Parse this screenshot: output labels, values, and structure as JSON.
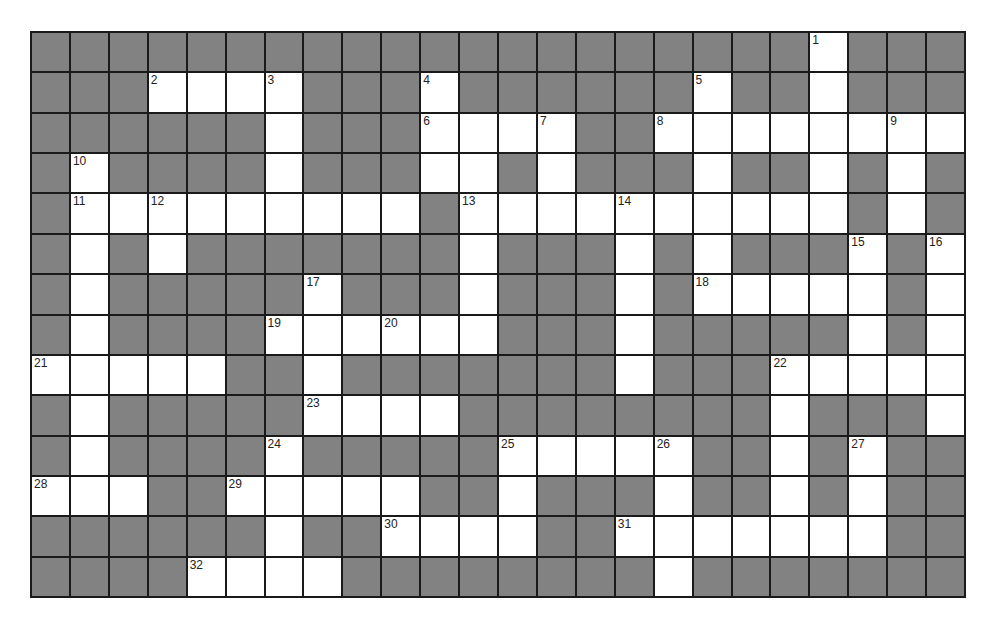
{
  "puzzle": {
    "type": "crossword",
    "columns": 24,
    "rows": 14,
    "colors": {
      "block": "#828282",
      "open": "#ffffff",
      "grid_line": "#1a1a1a"
    },
    "grid": [
      "XXXXXXXXXXXXXXXXXXXXWXXX",
      "XXXWWWWXXXWXXXXXXWXXWXXX",
      "XXXXXXWXXXWWWWXXWWWWWWWW",
      "XWXXXXWXXXWWXWXXXWXXWXWX",
      "XWWWWWWWWWXWWWWWWWWWWXWX",
      "XWXWXXXXXXXWXXXWXWXXXWXW",
      "XWXXXXXWXXXWXXXWXWWWWWXW",
      "XWXXXXWWWWWWXXXWXXXXXWXW",
      "WWWWWXXWXXXXXXXWXXXWWWWW",
      "XWXXXXXWWWWXXXXXXXXWXXXW",
      "XWXXXXWXXXXXWWWWWXXWXWXX",
      "WWWXXWWWWWXXWXXXWXXWXWXX",
      "XXXXXXWXXWWWWXXWWWWWWWXX",
      "XXXXWWWWXXXXXXXXWXXXXXXX"
    ],
    "numbers": [
      {
        "n": "1",
        "row": 0,
        "col": 20
      },
      {
        "n": "2",
        "row": 1,
        "col": 3
      },
      {
        "n": "3",
        "row": 1,
        "col": 6
      },
      {
        "n": "4",
        "row": 1,
        "col": 10
      },
      {
        "n": "5",
        "row": 1,
        "col": 17
      },
      {
        "n": "6",
        "row": 2,
        "col": 10
      },
      {
        "n": "7",
        "row": 2,
        "col": 13
      },
      {
        "n": "8",
        "row": 2,
        "col": 16
      },
      {
        "n": "9",
        "row": 2,
        "col": 22
      },
      {
        "n": "10",
        "row": 3,
        "col": 1
      },
      {
        "n": "11",
        "row": 4,
        "col": 1
      },
      {
        "n": "12",
        "row": 4,
        "col": 3
      },
      {
        "n": "13",
        "row": 4,
        "col": 11
      },
      {
        "n": "14",
        "row": 4,
        "col": 15
      },
      {
        "n": "15",
        "row": 5,
        "col": 21
      },
      {
        "n": "16",
        "row": 5,
        "col": 23
      },
      {
        "n": "17",
        "row": 6,
        "col": 7
      },
      {
        "n": "18",
        "row": 6,
        "col": 17
      },
      {
        "n": "19",
        "row": 7,
        "col": 6
      },
      {
        "n": "20",
        "row": 7,
        "col": 9
      },
      {
        "n": "21",
        "row": 8,
        "col": 0
      },
      {
        "n": "22",
        "row": 8,
        "col": 19
      },
      {
        "n": "23",
        "row": 9,
        "col": 7
      },
      {
        "n": "24",
        "row": 10,
        "col": 6
      },
      {
        "n": "25",
        "row": 10,
        "col": 12
      },
      {
        "n": "26",
        "row": 10,
        "col": 16
      },
      {
        "n": "27",
        "row": 10,
        "col": 21
      },
      {
        "n": "28",
        "row": 11,
        "col": 0
      },
      {
        "n": "29",
        "row": 11,
        "col": 5
      },
      {
        "n": "30",
        "row": 12,
        "col": 9
      },
      {
        "n": "31",
        "row": 12,
        "col": 15
      },
      {
        "n": "32",
        "row": 13,
        "col": 4
      }
    ]
  }
}
